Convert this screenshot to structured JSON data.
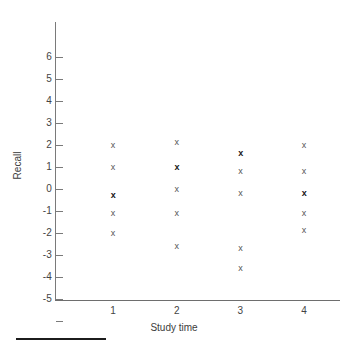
{
  "chart_data": {
    "type": "scatter",
    "title": "",
    "xlabel": "Study time",
    "ylabel": "Recall",
    "xlim": [
      0.5,
      4.6
    ],
    "ylim": [
      -6,
      6.6
    ],
    "grid": false,
    "legend": null,
    "x_ticks": [
      1,
      2,
      3,
      4
    ],
    "x_tick_labels": [
      "1",
      "2",
      "3",
      "4"
    ],
    "y_ticks": [
      6,
      5,
      4,
      3,
      2,
      1,
      0,
      -1,
      -2,
      -3,
      -4,
      -5,
      -6
    ],
    "y_tick_labels": [
      "6",
      "5",
      "4",
      "3",
      "2",
      "1",
      "0",
      "-1",
      "-2",
      "-3",
      "-4",
      "-5",
      "-6"
    ],
    "marker": "x",
    "points": [
      {
        "x": 1,
        "y": 2.0,
        "overlap": false
      },
      {
        "x": 1,
        "y": 1.0,
        "overlap": false
      },
      {
        "x": 1,
        "y": -0.3,
        "overlap": true
      },
      {
        "x": 1,
        "y": -1.1,
        "overlap": false
      },
      {
        "x": 1,
        "y": -2.0,
        "overlap": false
      },
      {
        "x": 2,
        "y": 2.1,
        "overlap": false
      },
      {
        "x": 2,
        "y": 1.0,
        "overlap": true
      },
      {
        "x": 2,
        "y": 0.0,
        "overlap": false
      },
      {
        "x": 2,
        "y": -1.1,
        "overlap": false
      },
      {
        "x": 2,
        "y": -2.6,
        "overlap": false
      },
      {
        "x": 3,
        "y": 1.6,
        "overlap": true
      },
      {
        "x": 3,
        "y": 0.8,
        "overlap": false
      },
      {
        "x": 3,
        "y": -0.2,
        "overlap": false
      },
      {
        "x": 3,
        "y": -2.7,
        "overlap": false
      },
      {
        "x": 3,
        "y": -3.6,
        "overlap": false
      },
      {
        "x": 4,
        "y": 2.0,
        "overlap": false
      },
      {
        "x": 4,
        "y": 0.8,
        "overlap": false
      },
      {
        "x": 4,
        "y": -0.2,
        "overlap": true
      },
      {
        "x": 4,
        "y": -1.1,
        "overlap": false
      },
      {
        "x": 4,
        "y": -1.9,
        "overlap": false
      }
    ],
    "colors": {
      "axis": "#7a7a7a",
      "marker": "#555555",
      "marker_overlap": "#161616",
      "text": "#3c3c3c",
      "background": "#ffffff",
      "footer_rule": "#1c1c1c"
    }
  }
}
